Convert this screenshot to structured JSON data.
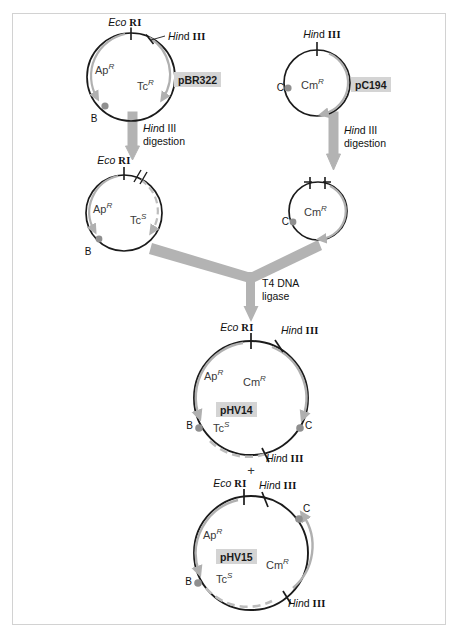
{
  "figure": {
    "plus_symbol": "+",
    "enzymes": {
      "ecori_italic": "Eco",
      "ecori_roman": "RI",
      "hindiii_italic": "Hin",
      "hindiii_d": "d",
      "hindiii_roman": "III"
    }
  },
  "steps": {
    "hindiii_digestion_left": {
      "line1_italic": "Hin",
      "line1_d": "d",
      "line1_roman": "III",
      "line2": "digestion"
    },
    "hindiii_digestion_right": {
      "line1_italic": "Hin",
      "line1_d": "d",
      "line1_roman": "III",
      "line2": "digestion"
    },
    "ligase": {
      "line1": "T4 DNA",
      "line2": "ligase"
    }
  },
  "plasmids": [
    {
      "id": "pBR322",
      "name": "pBR322",
      "genes": [
        {
          "label": "Ap",
          "sup": "R"
        },
        {
          "label": "Tc",
          "sup": "R"
        }
      ],
      "sites": [
        {
          "label_italic": "Eco",
          "label_roman": "RI"
        },
        {
          "label_italic": "Hin",
          "label_d": "d",
          "label_roman": "III"
        }
      ],
      "markers": [
        {
          "label": "B"
        }
      ]
    },
    {
      "id": "pC194",
      "name": "pC194",
      "genes": [
        {
          "label": "Cm",
          "sup": "R"
        }
      ],
      "sites": [
        {
          "label_italic": "Hin",
          "label_d": "d",
          "label_roman": "III"
        }
      ],
      "markers": [
        {
          "label": "C"
        }
      ]
    },
    {
      "id": "pBR322-cut",
      "name": "",
      "genes": [
        {
          "label": "Ap",
          "sup": "R"
        },
        {
          "label": "Tc",
          "sup": "S"
        }
      ],
      "sites": [
        {
          "label_italic": "Eco",
          "label_roman": "RI"
        }
      ],
      "markers": [
        {
          "label": "B"
        }
      ]
    },
    {
      "id": "pC194-cut",
      "name": "",
      "genes": [
        {
          "label": "Cm",
          "sup": "R"
        }
      ],
      "sites": [],
      "markers": [
        {
          "label": "C"
        }
      ]
    },
    {
      "id": "pHV14",
      "name": "pHV14",
      "genes": [
        {
          "label": "Ap",
          "sup": "R"
        },
        {
          "label": "Cm",
          "sup": "R"
        },
        {
          "label": "Tc",
          "sup": "S"
        }
      ],
      "sites": [
        {
          "label_italic": "Eco",
          "label_roman": "RI"
        },
        {
          "label_italic": "Hin",
          "label_d": "d",
          "label_roman": "III"
        },
        {
          "label_italic": "Hin",
          "label_d": "d",
          "label_roman": "III"
        }
      ],
      "markers": [
        {
          "label": "B"
        },
        {
          "label": "C"
        }
      ]
    },
    {
      "id": "pHV15",
      "name": "pHV15",
      "genes": [
        {
          "label": "Ap",
          "sup": "R"
        },
        {
          "label": "Cm",
          "sup": "R"
        },
        {
          "label": "Tc",
          "sup": "S"
        }
      ],
      "sites": [
        {
          "label_italic": "Eco",
          "label_roman": "RI"
        },
        {
          "label_italic": "Hin",
          "label_d": "d",
          "label_roman": "III"
        },
        {
          "label_italic": "Hin",
          "label_d": "d",
          "label_roman": "III"
        }
      ],
      "markers": [
        {
          "label": "C"
        },
        {
          "label": "B"
        }
      ]
    }
  ],
  "colors": {
    "dna_circle": "#1b1b1b",
    "gene_arc": "#b0b0b0",
    "flow_arrow": "#b3b3b3",
    "name_highlight": "#d4d4d4",
    "marker_dot": "#8f8f8f",
    "frame": "#d2d2d2"
  }
}
